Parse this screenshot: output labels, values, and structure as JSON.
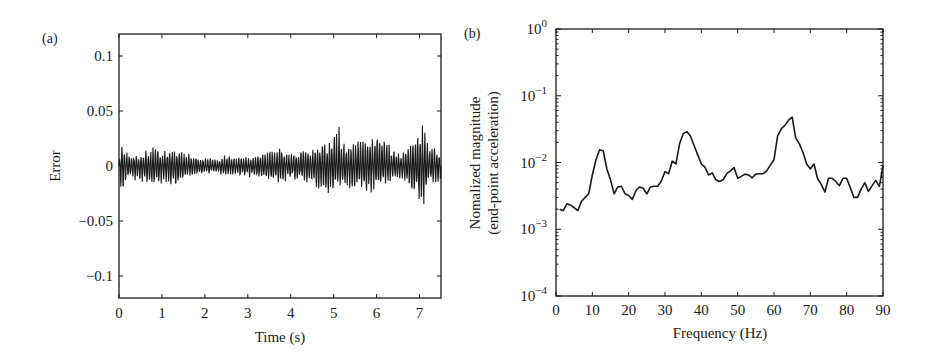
{
  "chart_data": [
    {
      "panel": "(a)",
      "type": "line",
      "title": "",
      "xlabel": "Time (s)",
      "ylabel": "Error",
      "xlim": [
        0,
        7.5
      ],
      "ylim": [
        -0.12,
        0.12
      ],
      "xticks": [
        0,
        1,
        2,
        3,
        4,
        5,
        6,
        7
      ],
      "xtick_labels": [
        "0",
        "1",
        "2",
        "3",
        "4",
        "5",
        "6",
        "7"
      ],
      "yticks": [
        0.1,
        0.05,
        0,
        -0.05,
        -0.1
      ],
      "ytick_labels": [
        "0.1",
        "0.05",
        "0",
        "−0.05",
        "−0.1"
      ],
      "grid": false,
      "legend": null,
      "description": "Dense oscillating error signal around zero; amplitude envelope (max/min) per time segment",
      "envelope": {
        "x": [
          0.0,
          0.05,
          0.2,
          0.5,
          0.8,
          1.0,
          1.3,
          1.5,
          1.8,
          2.0,
          2.3,
          2.5,
          2.8,
          3.0,
          3.3,
          3.6,
          3.8,
          4.0,
          4.3,
          4.6,
          4.9,
          5.1,
          5.3,
          5.6,
          5.9,
          6.05,
          6.3,
          6.6,
          6.9,
          7.05,
          7.2,
          7.5
        ],
        "upper": [
          0.005,
          0.025,
          0.012,
          0.012,
          0.017,
          0.016,
          0.017,
          0.012,
          0.01,
          0.008,
          0.006,
          0.011,
          0.008,
          0.01,
          0.012,
          0.015,
          0.022,
          0.012,
          0.015,
          0.02,
          0.025,
          0.04,
          0.02,
          0.026,
          0.026,
          0.036,
          0.02,
          0.012,
          0.024,
          0.044,
          0.02,
          0.015
        ],
        "lower": [
          -0.005,
          -0.03,
          -0.012,
          -0.015,
          -0.02,
          -0.018,
          -0.022,
          -0.012,
          -0.01,
          -0.008,
          -0.007,
          -0.012,
          -0.009,
          -0.01,
          -0.013,
          -0.015,
          -0.015,
          -0.012,
          -0.015,
          -0.022,
          -0.025,
          -0.022,
          -0.02,
          -0.024,
          -0.025,
          -0.025,
          -0.015,
          -0.014,
          -0.03,
          -0.045,
          -0.02,
          -0.015
        ]
      }
    },
    {
      "panel": "(b)",
      "type": "line",
      "title": "",
      "xlabel": "Frequency (Hz)",
      "ylabel": "Nomalized magnitude (end-point acceleration)",
      "yscale": "log",
      "xlim": [
        0,
        90
      ],
      "ylim": [
        0.0001,
        1
      ],
      "xticks": [
        0,
        10,
        20,
        30,
        40,
        50,
        60,
        70,
        80,
        90
      ],
      "xtick_labels": [
        "0",
        "10",
        "20",
        "30",
        "40",
        "50",
        "60",
        "70",
        "80",
        "90"
      ],
      "yticks": [
        1,
        0.1,
        0.01,
        0.001,
        0.0001
      ],
      "ytick_labels": [
        {
          "base": "10",
          "exp": "0"
        },
        {
          "base": "10",
          "exp": "−1"
        },
        {
          "base": "10",
          "exp": "−2"
        },
        {
          "base": "10",
          "exp": "−3"
        },
        {
          "base": "10",
          "exp": "−4"
        }
      ],
      "grid": false,
      "legend": null,
      "series": [
        {
          "name": "magnitude",
          "x": [
            1,
            2,
            3,
            4,
            5,
            6,
            7,
            8,
            9,
            10,
            11,
            12,
            13,
            14,
            15,
            16,
            17,
            18,
            19,
            20,
            21,
            22,
            23,
            24,
            25,
            26,
            27,
            28,
            29,
            30,
            31,
            32,
            33,
            34,
            35,
            36,
            37,
            38,
            39,
            40,
            41,
            42,
            43,
            44,
            45,
            46,
            47,
            48,
            49,
            50,
            51,
            52,
            53,
            54,
            55,
            56,
            57,
            58,
            59,
            60,
            61,
            62,
            63,
            64,
            65,
            66,
            67,
            68,
            69,
            70,
            71,
            72,
            73,
            74,
            75,
            76,
            77,
            78,
            79,
            80,
            81,
            82,
            83,
            84,
            85,
            86,
            87,
            88,
            89,
            90
          ],
          "values": [
            0.002,
            0.0019,
            0.0024,
            0.0023,
            0.0021,
            0.0019,
            0.0026,
            0.003,
            0.0034,
            0.0065,
            0.011,
            0.0155,
            0.015,
            0.008,
            0.0055,
            0.0034,
            0.0043,
            0.0044,
            0.0034,
            0.0032,
            0.0028,
            0.0038,
            0.0043,
            0.0041,
            0.0034,
            0.0043,
            0.0044,
            0.0044,
            0.0053,
            0.0073,
            0.0068,
            0.0105,
            0.0095,
            0.019,
            0.027,
            0.029,
            0.025,
            0.018,
            0.013,
            0.0095,
            0.0085,
            0.0065,
            0.007,
            0.0055,
            0.0052,
            0.0055,
            0.0068,
            0.0075,
            0.0084,
            0.0058,
            0.0062,
            0.0067,
            0.0065,
            0.0059,
            0.0067,
            0.0068,
            0.0068,
            0.0075,
            0.0092,
            0.011,
            0.025,
            0.032,
            0.036,
            0.043,
            0.048,
            0.023,
            0.019,
            0.014,
            0.0095,
            0.008,
            0.0095,
            0.0057,
            0.0047,
            0.0036,
            0.0058,
            0.0058,
            0.0052,
            0.0045,
            0.0058,
            0.0058,
            0.0042,
            0.003,
            0.003,
            0.004,
            0.005,
            0.0037,
            0.0045,
            0.0054,
            0.0044,
            0.009
          ]
        }
      ]
    }
  ],
  "panels": {
    "a": {
      "label": "(a)"
    },
    "b": {
      "label": "(b)"
    }
  },
  "colors": {
    "line": "#1a1a1a",
    "background": "#ffffff"
  }
}
